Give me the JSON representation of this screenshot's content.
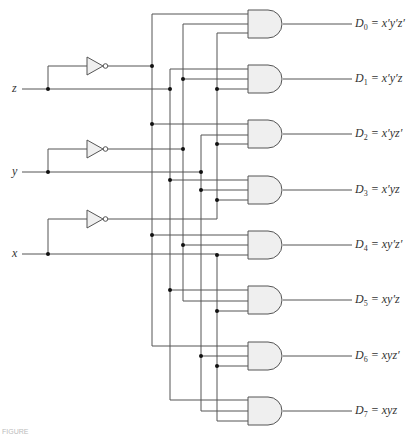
{
  "diagram": {
    "type": "3-to-8 line decoder",
    "inputs": [
      {
        "name": "z",
        "label": "z"
      },
      {
        "name": "y",
        "label": "y"
      },
      {
        "name": "x",
        "label": "x"
      }
    ],
    "outputs": [
      {
        "name": "D0",
        "sub": "0",
        "expr": "= x′y′z′"
      },
      {
        "name": "D1",
        "sub": "1",
        "expr": "= x′y′z"
      },
      {
        "name": "D2",
        "sub": "2",
        "expr": "= x′yz′"
      },
      {
        "name": "D3",
        "sub": "3",
        "expr": "= x′yz"
      },
      {
        "name": "D4",
        "sub": "4",
        "expr": "= xy′z′"
      },
      {
        "name": "D5",
        "sub": "5",
        "expr": "= xy′z"
      },
      {
        "name": "D6",
        "sub": "6",
        "expr": "= xyz′"
      },
      {
        "name": "D7",
        "sub": "7",
        "expr": "= xyz"
      }
    ],
    "gates": {
      "inverters": 3,
      "and_gates": 8,
      "and_inputs": 3
    },
    "colors": {
      "wire": "#555555",
      "gate_fill": "#efefef",
      "gate_stroke": "#555555",
      "dot": "#111111"
    },
    "caption": "FIGURE"
  }
}
